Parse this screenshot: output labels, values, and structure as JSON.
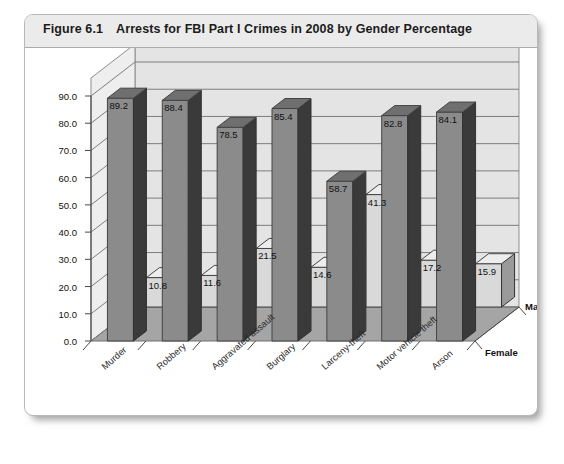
{
  "figure": {
    "number": "Figure 6.1",
    "title": "Arrests for FBI Part I Crimes in 2008 by Gender Percentage"
  },
  "colors": {
    "male_front": "#8b8b8b",
    "male_side": "#3a3a3a",
    "male_top": "#6f6f6f",
    "female_front": "#d9d9d9",
    "female_side": "#9a9a9a",
    "female_top": "#ededed",
    "wall": "#e4e4e4",
    "floor": "#a5a5a5",
    "grid": "#7d7d7d",
    "axis": "#4a4a4a"
  },
  "chart_data": {
    "type": "bar",
    "title": "Arrests for FBI Part I Crimes in 2008 by Gender Percentage",
    "xlabel": "",
    "ylabel": "",
    "ylim": [
      0,
      90
    ],
    "ytick_labels": [
      "0.0",
      "10.0",
      "20.0",
      "30.0",
      "40.0",
      "50.0",
      "60.0",
      "70.0",
      "80.0",
      "90.0"
    ],
    "ytick_values": [
      0,
      10,
      20,
      30,
      40,
      50,
      60,
      70,
      80,
      90
    ],
    "grid": true,
    "legend_position": "right-depth-axis",
    "projection": "3d",
    "categories": [
      "Murder",
      "Robbery",
      "Aggravated assault",
      "Burglary",
      "Larceny-theft",
      "Motor vehicle theft",
      "Arson"
    ],
    "series": [
      {
        "name": "Male",
        "values": [
          89.2,
          88.4,
          78.5,
          85.4,
          58.7,
          82.8,
          84.1
        ],
        "labels": [
          "89.2",
          "88.4",
          "78.5",
          "85.4",
          "58.7",
          "82.8",
          "84.1"
        ]
      },
      {
        "name": "Female",
        "values": [
          10.8,
          11.6,
          21.5,
          14.6,
          41.3,
          17.2,
          15.9
        ],
        "labels": [
          "10.8",
          "11.6",
          "21.5",
          "14.6",
          "41.3",
          "17.2",
          "15.9"
        ]
      }
    ]
  }
}
